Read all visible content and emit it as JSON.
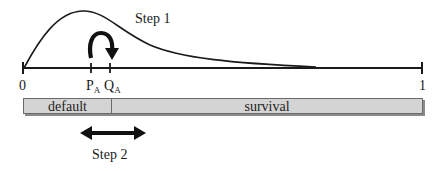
{
  "diagram": {
    "steps": {
      "step1_label": "Step 1",
      "step2_label": "Step 2"
    },
    "axis": {
      "start_label": "0",
      "end_label": "1",
      "points": [
        {
          "base": "P",
          "subscript": "A"
        },
        {
          "base": "Q",
          "subscript": "A"
        }
      ]
    },
    "bar": {
      "segments": [
        {
          "label": "default"
        },
        {
          "label": "survival"
        }
      ],
      "fill_color": "#d4d4d4",
      "border_color": "#6a6a6a"
    },
    "colors": {
      "line": "#1a1a1a",
      "background": "#ffffff"
    }
  }
}
